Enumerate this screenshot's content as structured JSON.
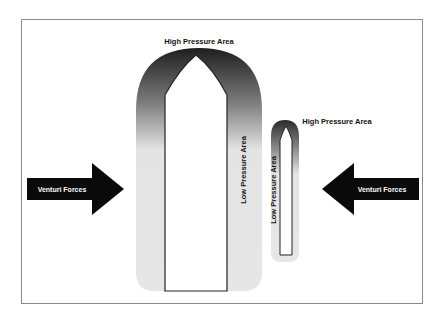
{
  "diagram": {
    "large_vessel": {
      "top_label": "High Pressure Area",
      "side_label": "Low Pressure Area"
    },
    "small_vessel": {
      "top_label": "High Pressure Area",
      "side_label": "Low Pressure Area"
    },
    "left_arrow": {
      "label": "Venturi Forces",
      "direction": "right"
    },
    "right_arrow": {
      "label": "Venturi Forces",
      "direction": "left"
    },
    "colors": {
      "high_pressure": "#2a2a2a",
      "low_pressure": "#e6e6e6",
      "arrow": "#0a0a0a",
      "frame": "#8a8a8a"
    }
  }
}
